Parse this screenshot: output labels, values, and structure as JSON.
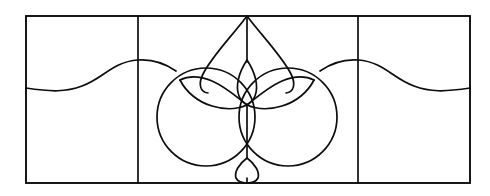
{
  "artwork": {
    "title": "Decorative Leaded Glass Panel Motif",
    "medium": "line drawing",
    "background_color": "#ffffff",
    "line_color": "#0d0d0d",
    "canvas": {
      "width": 490,
      "height": 196
    }
  },
  "frame": {
    "name": "outer rectangle border",
    "x": 26,
    "y": 16,
    "width": 444,
    "height": 167,
    "stroke_width": 1.9
  },
  "dividers": [
    {
      "name": "left vertical mullion",
      "x": 138,
      "y1": 16,
      "y2": 183
    },
    {
      "name": "right vertical mullion",
      "x": 358,
      "y1": 16,
      "y2": 183
    }
  ],
  "waves": [
    {
      "name": "left horizontal wave",
      "description": "gentle S-curve rising from the left border to a crest at the left mullion",
      "path": "M 26 88 C 52 92 66 92 82 86 C 104 78 112 62 138 60"
    },
    {
      "name": "right horizontal wave",
      "description": "gentle S-curve descending from the right mullion crest to the right border",
      "path": "M 358 60 C 384 62 392 78 414 86 C 430 92 444 92 470 88"
    },
    {
      "name": "left wave inner tail",
      "description": "short continuation from the mullion crest toward the motif shoulder",
      "path": "M 138 60 C 152 59 166 64 176 71"
    },
    {
      "name": "right wave inner tail",
      "description": "short continuation from the motif shoulder toward the mullion crest",
      "path": "M 320 71 C 330 64 344 59 358 60"
    }
  ],
  "motif": {
    "name": "central floral medallion",
    "center_x": 247,
    "apex_y": 16,
    "base_y": 183,
    "parts": [
      {
        "name": "center vertical stem upper",
        "path": "M 247 16 L 247 62"
      },
      {
        "name": "center vertical stem lower",
        "path": "M 247 104 L 247 158"
      },
      {
        "name": "center stem tip to base",
        "path": "M 247 178 L 247 183"
      },
      {
        "name": "outer teardrop left half",
        "path": "M 247 16 C 232 36 212 56 203 74 C 198 84 200 92 208 93"
      },
      {
        "name": "outer teardrop right half",
        "path": "M 247 16 C 262 36 282 56 291 74 C 296 84 294 92 286 93"
      },
      {
        "name": "central lens petal left",
        "path": "M 247 60 C 239 72 235 86 239 96 C 241 101 244 103 247 105"
      },
      {
        "name": "central lens petal right",
        "path": "M 247 60 C 255 72 259 86 255 96 C 253 101 250 103 247 105"
      },
      {
        "name": "left inner leaf upper edge",
        "path": "M 247 105 C 236 96 224 86 212 81 C 200 76 188 76 180 80"
      },
      {
        "name": "left inner leaf lower edge",
        "path": "M 180 80 C 186 92 198 102 212 106 C 225 110 238 109 247 105"
      },
      {
        "name": "right inner leaf upper edge",
        "path": "M 247 105 C 258 96 270 86 282 81 C 294 76 306 76 314 80"
      },
      {
        "name": "right inner leaf lower edge",
        "path": "M 314 80 C 308 92 296 102 282 106 C 269 110 256 109 247 105"
      },
      {
        "name": "left large circle",
        "cx": 206,
        "cy": 117,
        "r": 49
      },
      {
        "name": "right large circle",
        "cx": 288,
        "cy": 117,
        "r": 49
      },
      {
        "name": "bottom small petal left",
        "path": "M 247 158 C 239 164 234 172 236 178 C 238 182 243 183 247 183"
      },
      {
        "name": "bottom small petal right",
        "path": "M 247 158 C 255 164 260 172 258 178 C 256 182 251 183 247 183"
      }
    ]
  }
}
